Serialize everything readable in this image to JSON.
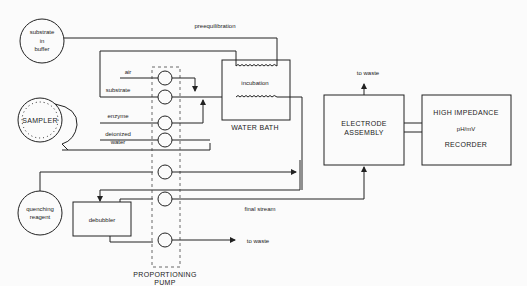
{
  "diagram": {
    "nodes": {
      "substrate_buffer": {
        "line1": "substrate",
        "line2": "in",
        "line3": "buffer"
      },
      "sampler": {
        "label": "SAMPLER"
      },
      "quenching": {
        "line1": "quenching",
        "line2": "reagent"
      },
      "debubbler": {
        "label": "debubbler"
      },
      "water_bath": {
        "label": "WATER BATH",
        "coil_label": "incubation"
      },
      "pump": {
        "line1": "PROPORTIONING",
        "line2": "PUMP"
      },
      "electrode": {
        "line1": "ELECTRODE",
        "line2": "ASSEMBLY"
      },
      "recorder": {
        "line1": "HIGH IMPEDANCE",
        "line2": "pH/mV",
        "line3": "RECORDER"
      }
    },
    "stream_labels": {
      "air": "air",
      "substrate": "substrate",
      "enzyme": "enzyme",
      "deionized": "deionized",
      "water": "water",
      "preequilibration": "preequilibration",
      "final_stream": "final stream",
      "to_waste_top": "to waste",
      "to_waste_bottom": "to waste"
    }
  }
}
